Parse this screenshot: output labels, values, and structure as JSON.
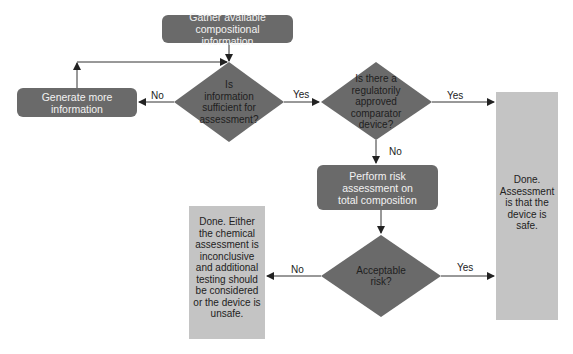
{
  "flowchart": {
    "nodes": {
      "gather": {
        "type": "process",
        "label": "Gather available compositional information"
      },
      "generate": {
        "type": "process",
        "label": "Generate more information"
      },
      "sufficient": {
        "type": "decision",
        "label": "Is information sufficient for assessment?"
      },
      "comparator": {
        "type": "decision",
        "label": "Is there a regulatorily approved comparator device?"
      },
      "risk_assessment": {
        "type": "process",
        "label": "Perform risk assessment on total composition"
      },
      "acceptable": {
        "type": "decision",
        "label": "Acceptable risk?"
      },
      "done_safe": {
        "type": "terminal",
        "label": "Done. Assessment is that the device is safe."
      },
      "done_unsafe": {
        "type": "terminal",
        "label": "Done. Either the chemical assessment is inconclusive and additional testing should be considered or the device is unsafe."
      }
    },
    "edges": [
      {
        "from": "gather",
        "to": "sufficient",
        "label": ""
      },
      {
        "from": "sufficient",
        "to": "generate",
        "label": "No"
      },
      {
        "from": "generate",
        "to": "sufficient",
        "label": ""
      },
      {
        "from": "sufficient",
        "to": "comparator",
        "label": "Yes"
      },
      {
        "from": "comparator",
        "to": "done_safe",
        "label": "Yes"
      },
      {
        "from": "comparator",
        "to": "risk_assessment",
        "label": "No"
      },
      {
        "from": "risk_assessment",
        "to": "acceptable",
        "label": ""
      },
      {
        "from": "acceptable",
        "to": "done_unsafe",
        "label": "No"
      },
      {
        "from": "acceptable",
        "to": "done_safe",
        "label": "Yes"
      }
    ],
    "edge_labels": {
      "sufficient_no": "No",
      "sufficient_yes": "Yes",
      "comparator_yes": "Yes",
      "comparator_no": "No",
      "acceptable_no": "No",
      "acceptable_yes": "Yes"
    },
    "colors": {
      "process_fill": "#6a6a6a",
      "decision_fill": "#6a6a6a",
      "terminal_fill": "#c4c4c4",
      "line": "#333333"
    }
  }
}
